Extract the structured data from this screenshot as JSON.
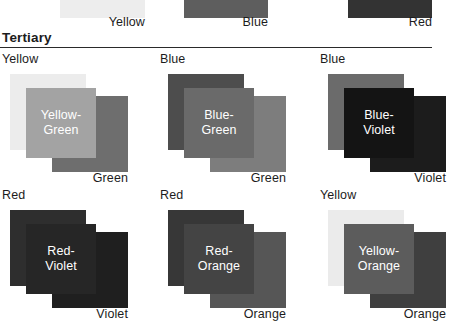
{
  "top_row": {
    "cells": [
      {
        "label": "Yellow",
        "swatch_color": "#ededed",
        "left": 60,
        "width": 85,
        "label_right_offset": 0
      },
      {
        "label": "Blue",
        "swatch_color": "#5e5e5e",
        "left": 184,
        "width": 84,
        "label_right_offset": 0
      },
      {
        "label": "Red",
        "swatch_color": "#333333",
        "left": 348,
        "width": 84,
        "label_right_offset": 0
      }
    ]
  },
  "section": {
    "heading": "Tertiary"
  },
  "tertiary": {
    "cells": [
      {
        "top_label": "Yellow",
        "bottom_label": "Green",
        "mix_line1": "Yellow-",
        "mix_line2": "Green",
        "color_a": "#ececec",
        "color_b": "#6e6e6e",
        "color_mix": "#a3a3a3",
        "mix_text_color": "#ffffff",
        "left": 0,
        "top": 0
      },
      {
        "top_label": "Blue",
        "bottom_label": "Green",
        "mix_line1": "Blue-",
        "mix_line2": "Green",
        "color_a": "#4d4d4d",
        "color_b": "#7d7d7d",
        "color_mix": "#6a6a6a",
        "mix_text_color": "#ffffff",
        "left": 158,
        "top": 0
      },
      {
        "top_label": "Blue",
        "bottom_label": "Violet",
        "mix_line1": "Blue-",
        "mix_line2": "Violet",
        "color_a": "#6b6b6b",
        "color_b": "#1c1c1c",
        "color_mix": "#141414",
        "mix_text_color": "#ffffff",
        "left": 318,
        "top": 0
      },
      {
        "top_label": "Red",
        "bottom_label": "Violet",
        "mix_line1": "Red-",
        "mix_line2": "Violet",
        "color_a": "#2e2e2e",
        "color_b": "#1f1f1f",
        "color_mix": "#262626",
        "mix_text_color": "#ffffff",
        "left": 0,
        "top": 136
      },
      {
        "top_label": "Red",
        "bottom_label": "Orange",
        "mix_line1": "Red-",
        "mix_line2": "Orange",
        "color_a": "#373737",
        "color_b": "#565656",
        "color_mix": "#444444",
        "mix_text_color": "#ffffff",
        "left": 158,
        "top": 136
      },
      {
        "top_label": "Yellow",
        "bottom_label": "Orange",
        "mix_line1": "Yellow-",
        "mix_line2": "Orange",
        "color_a": "#ebebeb",
        "color_b": "#3f3f3f",
        "color_mix": "#5c5c5c",
        "mix_text_color": "#ffffff",
        "left": 318,
        "top": 136
      }
    ]
  }
}
